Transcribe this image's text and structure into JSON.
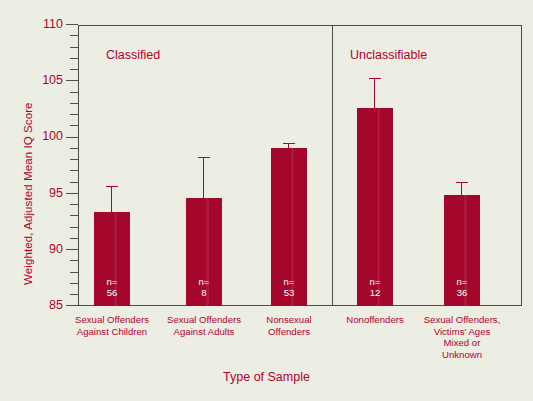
{
  "figure": {
    "background_color": "#edeee3",
    "accent_color": "#b3002d",
    "bar_color": "#a4062c",
    "frame_color": "#4a4f45"
  },
  "axes": {
    "ylabel": "Weighted, Adjusted Mean IQ Score",
    "xlabel": "Type of Sample",
    "ytick_labels": [
      "85",
      "90",
      "95",
      "100",
      "105",
      "110"
    ]
  },
  "panels": [
    {
      "title": "Classified"
    },
    {
      "title": "Unclassifiable"
    }
  ],
  "chart_data": {
    "type": "bar",
    "title": "",
    "xlabel": "Type of Sample",
    "ylabel": "Weighted, Adjusted Mean IQ Score",
    "ylim": [
      85,
      110
    ],
    "ytick_major": [
      85,
      90,
      95,
      100,
      105,
      110
    ],
    "ytick_minor_step": 1,
    "grid": false,
    "legend": null,
    "panel_groups": [
      "Classified",
      "Unclassifiable"
    ],
    "group_divider_after_category_index": 2,
    "categories": [
      "Sexual Offenders\nAgainst Children",
      "Sexual Offenders\nAgainst Adults",
      "Nonsexual\nOffenders",
      "Nonoffenders",
      "Sexual Offenders,\nVictims' Ages\nMixed or\nUnknown"
    ],
    "values": [
      93.4,
      94.6,
      99.1,
      102.6,
      94.9
    ],
    "error_upper": [
      95.7,
      98.3,
      99.5,
      105.3,
      96.0
    ],
    "n_labels": [
      "n=\n56",
      "n=\n8",
      "n=\n53",
      "n=\n12",
      "n=\n36"
    ],
    "n_values": [
      56,
      8,
      53,
      12,
      36
    ],
    "group_of_category": [
      "Classified",
      "Classified",
      "Classified",
      "Unclassifiable",
      "Unclassifiable"
    ]
  }
}
